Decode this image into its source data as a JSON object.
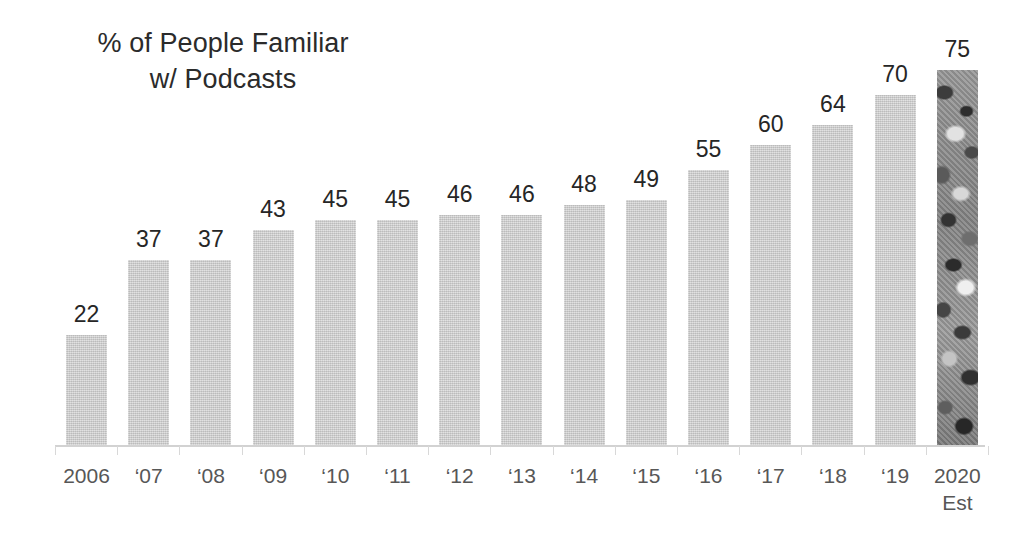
{
  "chart_data": {
    "type": "bar",
    "title": "% of People Familiar\nw/ Podcasts",
    "xlabel": "",
    "ylabel": "",
    "ylim": [
      0,
      78
    ],
    "grid": false,
    "legend": "none",
    "categories": [
      "2006",
      "‘07",
      "‘08",
      "‘09",
      "‘10",
      "‘11",
      "‘12",
      "‘13",
      "‘14",
      "‘15",
      "‘16",
      "‘17",
      "‘18",
      "‘19",
      "2020\nEst"
    ],
    "values": [
      22,
      37,
      37,
      43,
      45,
      45,
      46,
      46,
      48,
      49,
      55,
      60,
      64,
      70,
      75
    ],
    "data_labels": [
      "22",
      "37",
      "37",
      "43",
      "45",
      "45",
      "46",
      "46",
      "48",
      "49",
      "55",
      "60",
      "64",
      "70",
      "75"
    ],
    "bar_styles": [
      "solid",
      "solid",
      "solid",
      "solid",
      "solid",
      "solid",
      "solid",
      "solid",
      "solid",
      "solid",
      "solid",
      "solid",
      "solid",
      "solid",
      "textured"
    ]
  },
  "colors": {
    "background": "#ffffff",
    "bar_fill": "#c9c9c9",
    "bar_fill_textured": "#8d8d8d",
    "axis_line": "#d2d2d2",
    "value_label_text": "#262626",
    "category_label_text": "#575757",
    "title_text": "#2b2b2b"
  }
}
